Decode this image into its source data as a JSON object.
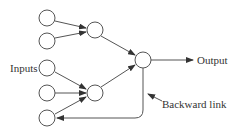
{
  "diagram": {
    "type": "recurrent-neural-network",
    "labels": {
      "inputs": "Inputs",
      "output": "Output",
      "backward_link": "Backward link"
    },
    "nodes": [
      {
        "id": "in1",
        "role": "input",
        "cx": 47,
        "cy": 18
      },
      {
        "id": "in2",
        "role": "input",
        "cx": 47,
        "cy": 41
      },
      {
        "id": "in3",
        "role": "input",
        "cx": 47,
        "cy": 68
      },
      {
        "id": "in4",
        "role": "input",
        "cx": 47,
        "cy": 93
      },
      {
        "id": "in5",
        "role": "input",
        "cx": 47,
        "cy": 118
      },
      {
        "id": "h1",
        "role": "hidden",
        "cx": 95,
        "cy": 30
      },
      {
        "id": "h2",
        "role": "hidden",
        "cx": 95,
        "cy": 93
      },
      {
        "id": "out",
        "role": "output",
        "cx": 143,
        "cy": 60
      }
    ],
    "edges": [
      {
        "from": "in1",
        "to": "h1"
      },
      {
        "from": "in2",
        "to": "h1"
      },
      {
        "from": "in3",
        "to": "h2"
      },
      {
        "from": "in4",
        "to": "h2"
      },
      {
        "from": "in5",
        "to": "h2"
      },
      {
        "from": "h1",
        "to": "out"
      },
      {
        "from": "h2",
        "to": "out"
      },
      {
        "from": "out",
        "to": "output-label"
      },
      {
        "from": "out",
        "to": "in5",
        "kind": "backward"
      }
    ],
    "colors": {
      "stroke": "#555555",
      "text": "#333333",
      "background": "#ffffff"
    }
  }
}
